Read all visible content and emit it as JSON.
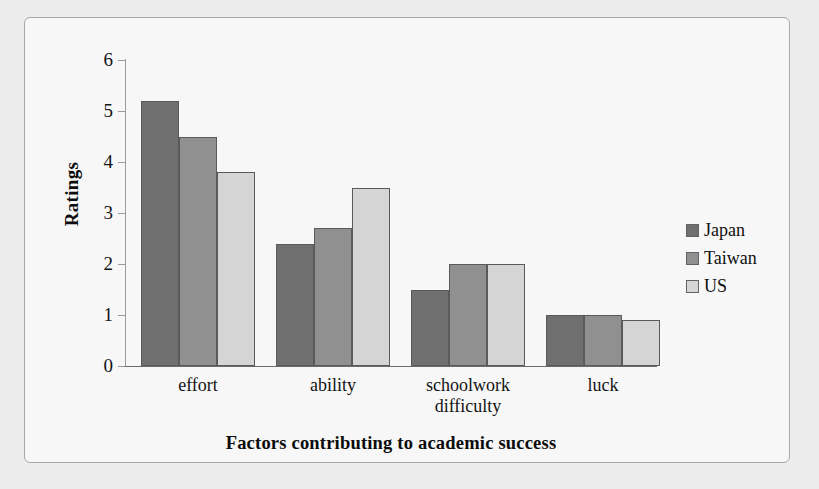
{
  "chart_data": {
    "type": "bar",
    "title": "",
    "xlabel": "Factors contributing to academic success",
    "ylabel": "Ratings",
    "ylim": [
      0,
      6
    ],
    "y_ticks": [
      "0",
      "1",
      "2",
      "3",
      "4",
      "5",
      "6"
    ],
    "grid": false,
    "legend_position": "right",
    "categories": [
      "effort",
      "ability",
      "schoolwork difficulty",
      "luck"
    ],
    "category_lines": [
      [
        "effort"
      ],
      [
        "ability"
      ],
      [
        "schoolwork",
        "difficulty"
      ],
      [
        "luck"
      ]
    ],
    "series": [
      {
        "name": "Japan",
        "color": "#6f6f6f",
        "values": [
          5.2,
          2.4,
          1.5,
          1.0
        ]
      },
      {
        "name": "Taiwan",
        "color": "#909090",
        "values": [
          4.5,
          2.7,
          2.0,
          1.0
        ]
      },
      {
        "name": "US",
        "color": "#d5d5d5",
        "values": [
          3.8,
          3.5,
          2.0,
          0.9
        ]
      }
    ]
  },
  "colors": {
    "page_background": "#ececed",
    "plot_background": "#f7f7f7",
    "frame_border": "#a9a9ad",
    "axis": "#6a6a6a",
    "text": "#101010",
    "japan": "#6f6f6f",
    "taiwan": "#909090",
    "us": "#d5d5d5"
  }
}
